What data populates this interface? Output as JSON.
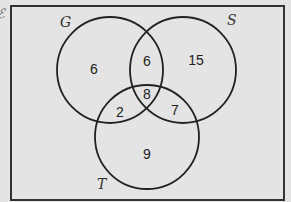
{
  "diagram": {
    "type": "venn",
    "universe_label": "ℰ",
    "sets": [
      {
        "name": "G",
        "label": "G",
        "cx": 110,
        "cy": 70,
        "r": 53,
        "label_x": 60,
        "label_y": 27
      },
      {
        "name": "S",
        "label": "S",
        "cx": 183,
        "cy": 70,
        "r": 53,
        "label_x": 227,
        "label_y": 25
      },
      {
        "name": "T",
        "label": "T",
        "cx": 147,
        "cy": 137,
        "r": 52,
        "label_x": 97,
        "label_y": 189
      }
    ],
    "regions": [
      {
        "id": "G_only",
        "value": "6",
        "x": 94,
        "y": 69
      },
      {
        "id": "G_and_S_only",
        "value": "6",
        "x": 147,
        "y": 61
      },
      {
        "id": "S_only",
        "value": "15",
        "x": 196,
        "y": 60
      },
      {
        "id": "G_S_T",
        "value": "8",
        "x": 147,
        "y": 94
      },
      {
        "id": "G_and_T_only",
        "value": "2",
        "x": 120,
        "y": 112
      },
      {
        "id": "S_and_T_only",
        "value": "7",
        "x": 175,
        "y": 110
      },
      {
        "id": "T_only",
        "value": "9",
        "x": 147,
        "y": 154
      }
    ],
    "colors": {
      "background": "#e4e4e4",
      "stroke": "#222222",
      "border": "#333333"
    }
  }
}
